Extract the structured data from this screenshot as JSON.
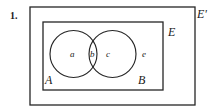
{
  "figure": {
    "item_number": "1.",
    "background_color": "#ffffff",
    "stroke_color": "#262626",
    "universal_set_outer_label": "E'",
    "universal_set_inner_label": "E",
    "set_labels": {
      "left_circle": "A",
      "right_circle": "B"
    },
    "region_labels": {
      "left_only": "a",
      "intersection": "b",
      "right_only": "c",
      "outside_circles": "e"
    },
    "shapes": {
      "outer_rectangle": {
        "x": 30,
        "y": 7,
        "width": 165,
        "height": 98
      },
      "inner_rectangle": {
        "x": 43,
        "y": 22,
        "width": 120,
        "height": 68
      },
      "left_circle": {
        "cx": 73.5,
        "cy": 54,
        "r": 23.5
      },
      "right_circle": {
        "cx": 112.5,
        "cy": 54,
        "r": 23.5
      }
    }
  }
}
